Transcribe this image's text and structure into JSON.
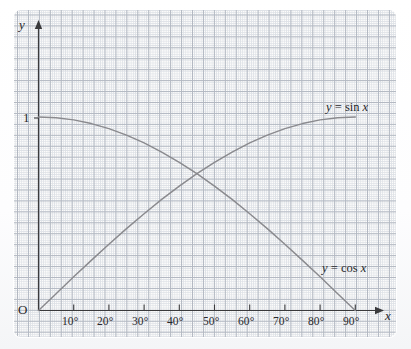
{
  "figure": {
    "origin_label": "O",
    "unit_label": "1",
    "x_axis_name": "x",
    "y_axis_name": "y"
  },
  "labels": {
    "sin_curve": {
      "lhs": "y",
      "eq": "=",
      "fn": "sin",
      "arg": "x",
      "full": "y = sin x"
    },
    "cos_curve": {
      "lhs": "y",
      "eq": "=",
      "fn": "cos",
      "arg": "x",
      "full": "y = cos x"
    }
  },
  "colors": {
    "curve": "#8a8a8e",
    "axis": "#3a3a3c",
    "grid_minor": "#d9dde3",
    "grid_major": "#b0b6c0",
    "paper": "#fcfcfb"
  },
  "chart_data": {
    "type": "line",
    "title": "",
    "xlabel": "x",
    "ylabel": "y",
    "xlim": [
      0,
      90
    ],
    "ylim": [
      0,
      1.18
    ],
    "grid": true,
    "legend": "inline-curve-labels",
    "x_tick_labels": [
      "10°",
      "20°",
      "30°",
      "40°",
      "50°",
      "60°",
      "70°",
      "80°",
      "90°"
    ],
    "x_tick_values": [
      10,
      20,
      30,
      40,
      50,
      60,
      70,
      80,
      90
    ],
    "y_tick_labels": [
      "1"
    ],
    "y_tick_values": [
      1
    ],
    "x": [
      0,
      5,
      10,
      15,
      20,
      25,
      30,
      35,
      40,
      45,
      50,
      55,
      60,
      65,
      70,
      75,
      80,
      85,
      90
    ],
    "series": [
      {
        "name": "y = sin x",
        "label_text": "y = sin x",
        "values": [
          0,
          0.087,
          0.174,
          0.259,
          0.342,
          0.423,
          0.5,
          0.574,
          0.643,
          0.707,
          0.766,
          0.819,
          0.866,
          0.906,
          0.94,
          0.966,
          0.985,
          0.996,
          1
        ]
      },
      {
        "name": "y = cos x",
        "label_text": "y = cos x",
        "values": [
          1,
          0.996,
          0.985,
          0.966,
          0.94,
          0.906,
          0.866,
          0.819,
          0.766,
          0.707,
          0.643,
          0.574,
          0.5,
          0.423,
          0.342,
          0.259,
          0.174,
          0.087,
          0
        ]
      }
    ],
    "intersection": {
      "x": 45,
      "y": 0.707,
      "note": "sin x = cos x at 45°"
    }
  }
}
